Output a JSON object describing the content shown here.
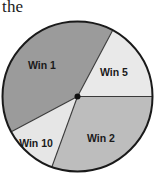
{
  "caption": {
    "text": "the"
  },
  "spinner": {
    "title": "Spinner wheel divided into four win sectors",
    "center_dot_label": "spinner-pivot",
    "geometry": {
      "cx": 77.5,
      "cy": 96.5,
      "r": 75.0
    },
    "colors": {
      "outline": "#1a1a1a",
      "win1_fill": "#9b9b9b",
      "win5_fill": "#e9e9e9",
      "win2_fill": "#bdbdbd",
      "win10_fill": "#e6e6e6",
      "divider": "#3a3a3a",
      "pivot": "#111111",
      "label_text": "#1a1a1a",
      "background": "#ffffff"
    },
    "sectors": [
      {
        "id": "win1",
        "label": "Win 1",
        "fill": "#9b9b9b",
        "start_angle_deg": 62,
        "end_angle_deg": 208,
        "sweep_deg": 146,
        "label_x": 42,
        "label_y": 66
      },
      {
        "id": "win5",
        "label": "Win 5",
        "fill": "#e9e9e9",
        "start_angle_deg": 0,
        "end_angle_deg": 62,
        "sweep_deg": 62,
        "label_x": 114,
        "label_y": 73
      },
      {
        "id": "win10",
        "label": "Win 10",
        "fill": "#e6e6e6",
        "start_angle_deg": 208,
        "end_angle_deg": 250,
        "sweep_deg": 42,
        "label_x": 36,
        "label_y": 144
      },
      {
        "id": "win2",
        "label": "Win 2",
        "fill": "#bdbdbd",
        "start_angle_deg": 250,
        "end_angle_deg": 360,
        "sweep_deg": 110,
        "label_x": 101,
        "label_y": 139
      }
    ]
  }
}
